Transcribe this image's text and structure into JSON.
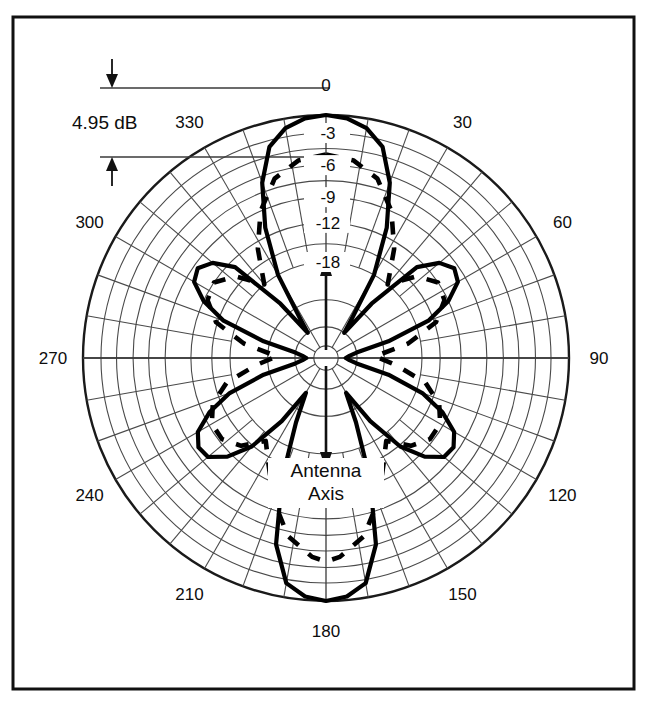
{
  "figure": {
    "caption_line1": "Antenna",
    "caption_line2": "Axis",
    "gain_annotation": "4.95 dB",
    "colors": {
      "frame": "#111111",
      "grid": "#4a4a4a",
      "pattern": "#000000",
      "background": "#ffffff"
    }
  },
  "chart_data": {
    "type": "line",
    "subtype": "polar-antenna-radiation-pattern",
    "title": "",
    "xlabel": "",
    "ylabel": "",
    "angle_unit": "degrees",
    "value_unit": "dB",
    "grid": true,
    "legend_position": "none",
    "angle_tick_labels": [
      "0",
      "30",
      "60",
      "90",
      "120",
      "150",
      "180",
      "210",
      "240",
      "270",
      "300",
      "330"
    ],
    "angle_ticks": [
      0,
      30,
      60,
      90,
      120,
      150,
      180,
      210,
      240,
      270,
      300,
      330
    ],
    "radial_tick_labels": [
      "-3",
      "-6",
      "-9",
      "-12",
      "-18"
    ],
    "radial_ticks": [
      -3,
      -6,
      -9,
      -12,
      -18
    ],
    "rlim": [
      -40,
      0
    ],
    "annotations": [
      {
        "text": "4.95 dB",
        "kind": "gain-marker",
        "position": "upper-left"
      },
      {
        "text": "Antenna Axis",
        "kind": "axis-caption",
        "position": "center-below"
      }
    ],
    "series": [
      {
        "name": "E-plane pattern",
        "style": "solid",
        "angles": [
          0,
          5,
          10,
          15,
          20,
          25,
          30,
          33,
          36,
          40,
          45,
          50,
          55,
          60,
          65,
          70,
          75,
          80,
          85,
          90,
          95,
          100,
          105,
          110,
          115,
          120,
          125,
          130,
          135,
          140,
          145,
          150,
          155,
          160,
          165,
          170,
          175,
          180,
          185,
          190,
          195,
          200,
          205,
          210,
          215,
          220,
          225,
          230,
          235,
          240,
          245,
          250,
          255,
          260,
          265,
          270,
          275,
          280,
          285,
          290,
          295,
          300,
          305,
          310,
          315,
          320,
          324,
          327,
          330,
          335,
          340,
          345,
          350,
          355,
          360
        ],
        "values": [
          0,
          -0.4,
          -1.6,
          -3.6,
          -6.6,
          -11,
          -18,
          -26,
          -30,
          -22,
          -13,
          -10.5,
          -9.5,
          -10,
          -12,
          -16,
          -23,
          -30,
          -34,
          -36,
          -34,
          -30,
          -23,
          -17,
          -13,
          -10.5,
          -9.6,
          -9.8,
          -11.5,
          -15,
          -21,
          -28,
          -22,
          -13,
          -6,
          -2.4,
          -0.6,
          0,
          -0.6,
          -2.4,
          -6,
          -13,
          -22,
          -28,
          -21,
          -15,
          -11.5,
          -9.8,
          -9.6,
          -10.5,
          -13,
          -17,
          -23,
          -30,
          -34,
          -36,
          -34,
          -30,
          -23,
          -16,
          -12,
          -10,
          -9.5,
          -10.5,
          -13,
          -22,
          -30,
          -26,
          -18,
          -11,
          -6.6,
          -3.6,
          -1.6,
          -0.4,
          0
        ]
      },
      {
        "name": "H-plane pattern",
        "style": "dashed",
        "angles": [
          0,
          8,
          16,
          24,
          32,
          40,
          48,
          56,
          64,
          72,
          80,
          88,
          96,
          104,
          112,
          120,
          128,
          136,
          144,
          152,
          160,
          168,
          176,
          180,
          184,
          192,
          200,
          208,
          216,
          224,
          232,
          240,
          248,
          256,
          264,
          272,
          280,
          288,
          296,
          304,
          312,
          320,
          328,
          336,
          344,
          352,
          360
        ],
        "values": [
          -5,
          -5.4,
          -6.6,
          -9,
          -13,
          -18,
          -14,
          -12,
          -12.5,
          -15,
          -20,
          -26,
          -22,
          -17,
          -14,
          -12.5,
          -12.5,
          -14,
          -17,
          -14,
          -10,
          -7,
          -5.4,
          -5,
          -5.4,
          -7,
          -10,
          -14,
          -17,
          -14,
          -12.5,
          -12.5,
          -14,
          -17,
          -22,
          -26,
          -20,
          -15,
          -12.5,
          -12,
          -14,
          -18,
          -13,
          -9,
          -6.6,
          -5.4,
          -5
        ]
      }
    ]
  }
}
